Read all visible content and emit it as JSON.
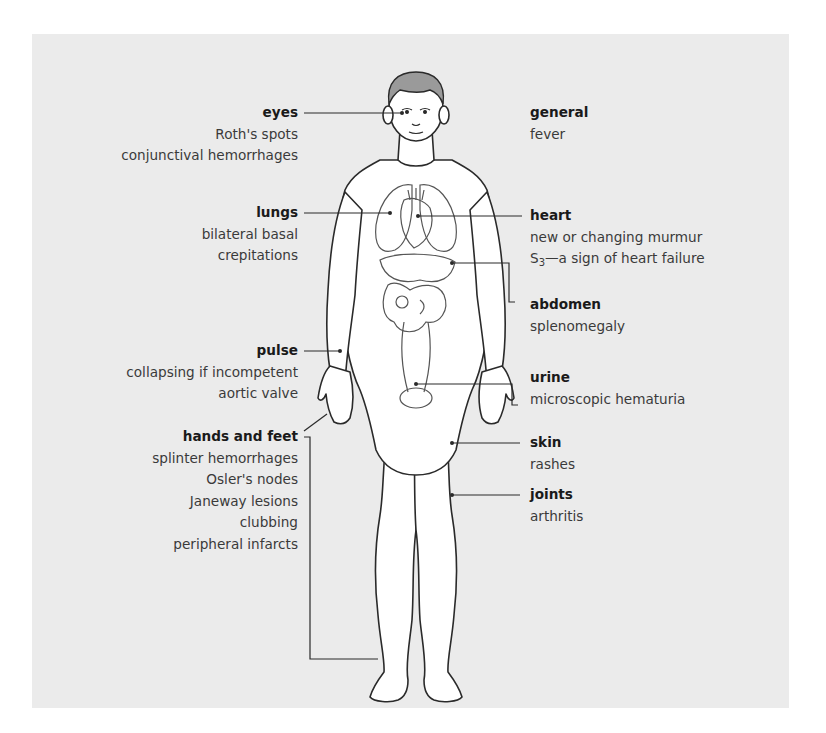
{
  "diagram": {
    "type": "anatomical-annotation",
    "colors": {
      "panel_background": "#ebebeb",
      "body_fill": "#ffffff",
      "outline": "#2a2a2a",
      "organs": "#555555",
      "hair": "#9a9a9a"
    }
  },
  "left_labels": [
    {
      "key": "eyes",
      "title": "eyes",
      "items": [
        "Roth's spots",
        "conjunctival hemorrhages"
      ]
    },
    {
      "key": "lungs",
      "title": "lungs",
      "items": [
        "bilateral basal",
        "crepitations"
      ]
    },
    {
      "key": "pulse",
      "title": "pulse",
      "items": [
        "collapsing if incompetent",
        "aortic valve"
      ]
    },
    {
      "key": "hands-feet",
      "title": "hands and feet",
      "items": [
        "splinter hemorrhages",
        "Osler's nodes",
        "Janeway lesions",
        "clubbing",
        "peripheral infarcts"
      ]
    }
  ],
  "right_labels": [
    {
      "key": "general",
      "title": "general",
      "items": [
        "fever"
      ]
    },
    {
      "key": "heart",
      "title": "heart",
      "items": [
        "new or changing murmur",
        "—a sign of heart failure"
      ],
      "s3_prefix": "S",
      "s3_sub": "3"
    },
    {
      "key": "abdomen",
      "title": "abdomen",
      "items": [
        "splenomegaly"
      ]
    },
    {
      "key": "urine",
      "title": "urine",
      "items": [
        "microscopic hematuria"
      ]
    },
    {
      "key": "skin",
      "title": "skin",
      "items": [
        "rashes"
      ]
    },
    {
      "key": "joints",
      "title": "joints",
      "items": [
        "arthritis"
      ]
    }
  ]
}
